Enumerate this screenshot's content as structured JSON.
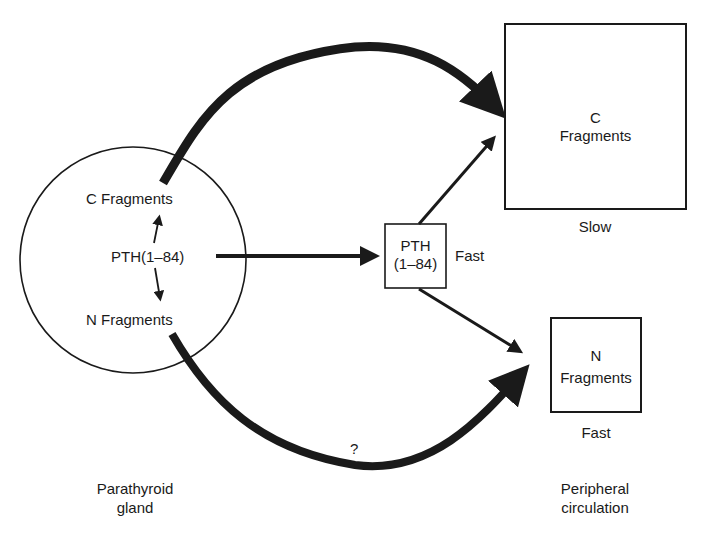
{
  "gland": {
    "c_fragments": "C Fragments",
    "pth": "PTH(1–84)",
    "n_fragments": "N Fragments",
    "caption_line1": "Parathyroid",
    "caption_line2": "gland"
  },
  "intermediate": {
    "box_line1": "PTH",
    "box_line2": "(1–84)",
    "rate": "Fast"
  },
  "c_pool": {
    "line1": "C",
    "line2": "Fragments",
    "rate": "Slow"
  },
  "n_pool": {
    "line1": "N",
    "line2": "Fragments",
    "rate": "Fast"
  },
  "unknown_pathway": "?",
  "periphery": {
    "caption_line1": "Peripheral",
    "caption_line2": "circulation"
  }
}
